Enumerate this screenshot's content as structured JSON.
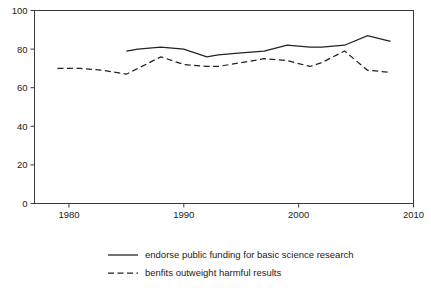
{
  "chart_data": {
    "type": "line",
    "title": "",
    "subtitle": "",
    "xlabel": "",
    "ylabel": "",
    "xlim": [
      1977,
      2010
    ],
    "ylim": [
      0,
      100
    ],
    "grid": false,
    "legend_position": "bottom",
    "x_ticks": [
      1980,
      1990,
      2000,
      2010
    ],
    "x_tick_labels": [
      "1980",
      "1990",
      "2000",
      "2010"
    ],
    "y_ticks": [
      0,
      20,
      40,
      60,
      80,
      100
    ],
    "y_tick_labels": [
      "0",
      "20",
      "40",
      "60",
      "80",
      "100"
    ],
    "series": [
      {
        "name": "endorse public funding for basic science research",
        "style": "solid",
        "color": "#222222",
        "x": [
          1985,
          1986,
          1988,
          1990,
          1992,
          1993,
          1995,
          1997,
          1999,
          2001,
          2002,
          2004,
          2006,
          2008
        ],
        "values": [
          79,
          80,
          81,
          80,
          76,
          77,
          78,
          79,
          82,
          81,
          81,
          82,
          87,
          84
        ]
      },
      {
        "name": "benfits outweight harmful results",
        "style": "dashed",
        "color": "#222222",
        "x": [
          1979,
          1981,
          1983,
          1985,
          1986,
          1988,
          1990,
          1992,
          1993,
          1995,
          1997,
          1999,
          2001,
          2002,
          2004,
          2006,
          2008
        ],
        "values": [
          70,
          70,
          69,
          67,
          70,
          76,
          72,
          71,
          71,
          73,
          75,
          74,
          71,
          73,
          79,
          69,
          68
        ]
      }
    ]
  },
  "legend": {
    "entries": [
      {
        "label": "endorse public funding for basic science research",
        "style": "solid"
      },
      {
        "label": "benfits outweight harmful results",
        "style": "dashed"
      }
    ]
  }
}
